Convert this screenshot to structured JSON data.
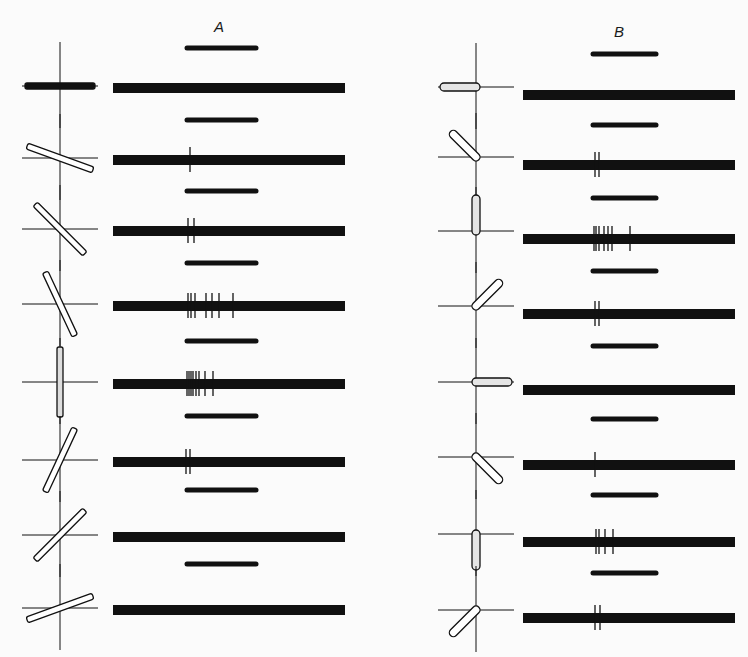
{
  "figure": {
    "columns": [
      {
        "label": "A",
        "label_pos": [
          214,
          30
        ],
        "cross_x": 60,
        "band_x": [
          113,
          345
        ],
        "short_x": [
          187,
          256
        ],
        "rows": [
          {
            "angle_deg": 0,
            "pivot": "center",
            "short_y": 48,
            "band_y": 88,
            "lines": []
          },
          {
            "angle_deg": 20,
            "pivot": "center",
            "short_y": 120,
            "band_y": 160,
            "lines": [
              190
            ]
          },
          {
            "angle_deg": 45,
            "pivot": "center",
            "short_y": 191,
            "band_y": 231,
            "lines": [
              188,
              194
            ]
          },
          {
            "angle_deg": 65,
            "pivot": "center",
            "short_y": 263,
            "band_y": 306,
            "lines": [
              188,
              191,
              195,
              206,
              212,
              219,
              233
            ]
          },
          {
            "angle_deg": 90,
            "pivot": "center",
            "short_y": 341,
            "band_y": 384,
            "lines": [
              187,
              189,
              191,
              193,
              196,
              199,
              205,
              213
            ]
          },
          {
            "angle_deg": -65,
            "pivot": "center",
            "short_y": 416,
            "band_y": 462,
            "lines": [
              186,
              190
            ]
          },
          {
            "angle_deg": -45,
            "pivot": "center",
            "short_y": 490,
            "band_y": 537,
            "lines": []
          },
          {
            "angle_deg": -20,
            "pivot": "center",
            "short_y": 564,
            "band_y": 610,
            "lines": []
          }
        ]
      },
      {
        "label": "B",
        "label_pos": [
          616,
          36
        ],
        "cross_x": 476,
        "band_x": [
          523,
          735
        ],
        "short_x": [
          593,
          656
        ],
        "rows": [
          {
            "angle_deg": 180,
            "pivot": "end",
            "short_y": 54,
            "band_y": 95,
            "lines": []
          },
          {
            "angle_deg": 225,
            "pivot": "end",
            "short_y": 125,
            "band_y": 165,
            "lines": [
              595,
              599
            ]
          },
          {
            "angle_deg": 270,
            "pivot": "end",
            "short_y": 198,
            "band_y": 239,
            "lines": [
              594,
              596,
              599,
              604,
              608,
              612,
              630
            ]
          },
          {
            "angle_deg": 315,
            "pivot": "end",
            "short_y": 271,
            "band_y": 314,
            "lines": [
              595,
              599
            ]
          },
          {
            "angle_deg": 0,
            "pivot": "end",
            "short_y": 346,
            "band_y": 390,
            "lines": []
          },
          {
            "angle_deg": 45,
            "pivot": "end",
            "short_y": 419,
            "band_y": 465,
            "lines": [
              595
            ]
          },
          {
            "angle_deg": 90,
            "pivot": "end",
            "short_y": 495,
            "band_y": 542,
            "lines": [
              596,
              599,
              605,
              613
            ]
          },
          {
            "angle_deg": 135,
            "pivot": "end",
            "short_y": 573,
            "band_y": 618,
            "lines": [
              595,
              600
            ]
          }
        ]
      }
    ]
  },
  "colors": {
    "ink": "#111111",
    "paper": "#fbfbfb"
  }
}
